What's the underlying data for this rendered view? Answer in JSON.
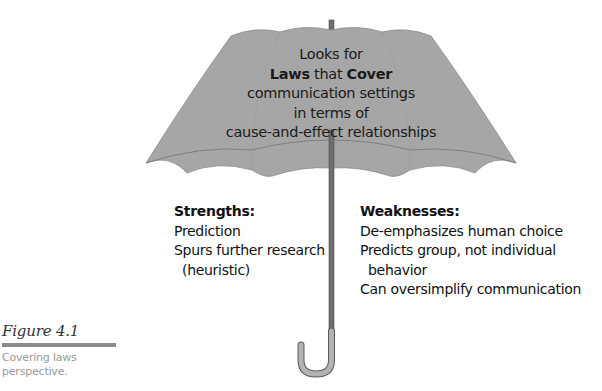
{
  "figure": {
    "label": "Figure 4.1",
    "caption_line1": "Covering laws",
    "caption_line2": "perspective."
  },
  "umbrella": {
    "canopy_color": "#a6a6a6",
    "canopy_edge_color": "#7f7f7f",
    "shaft_color": "#6e6e6e",
    "handle_color": "#b3b3b3",
    "text": {
      "line1": "Looks for",
      "line2_bold1": "Laws",
      "line2_mid": " that ",
      "line2_bold2": "Cover",
      "line3": "communication settings",
      "line4": "in terms of",
      "line5": "cause-and-effect relationships"
    }
  },
  "strengths": {
    "heading": "Strengths:",
    "items": [
      "Prediction",
      "Spurs further research",
      "(heuristic)"
    ]
  },
  "weaknesses": {
    "heading": "Weaknesses:",
    "items": [
      "De-emphasizes human choice",
      "Predicts group, not individual",
      "behavior",
      "Can oversimplify communication"
    ]
  }
}
